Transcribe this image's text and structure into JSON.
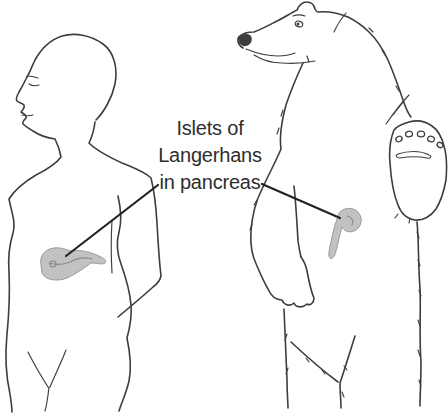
{
  "illustration": {
    "label": {
      "line1": "Islets of",
      "line2": "Langerhans",
      "line3": "in pancreas"
    }
  },
  "colors": {
    "background": "#ffffff",
    "ink": "#3d3d3d",
    "leader": "#222222",
    "label_text": "#2e2e2e",
    "pancreas_fill": "#c9c9c9",
    "pancreas_dot": "#8a8a8a",
    "pancreas_outline": "#9c9c9c"
  }
}
